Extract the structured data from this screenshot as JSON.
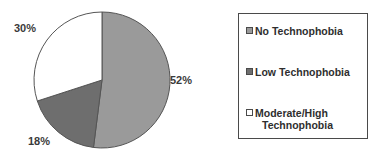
{
  "chart_data": {
    "type": "pie",
    "title": "",
    "subtitle": "",
    "xlabel": "",
    "ylabel": "",
    "grid": false,
    "legend_position": "right",
    "categories": [
      "No Technophobia",
      "Low Technophobia",
      "Moderate/High Technophobia"
    ],
    "values": [
      52,
      18,
      30
    ],
    "value_labels": [
      "52%",
      "18%",
      "30%"
    ],
    "unit": "%",
    "start_angle_deg": 0,
    "direction": "clockwise",
    "slices": [
      {
        "label": "No Technophobia",
        "value": 52,
        "display": "52%",
        "color": "#9a9a9a",
        "start_deg": 0,
        "end_deg": 187.2
      },
      {
        "label": "Low Technophobia",
        "value": 18,
        "display": "18%",
        "color": "#6e6e6e",
        "start_deg": 187.2,
        "end_deg": 252.0
      },
      {
        "label": "Moderate/High Technophobia",
        "value": 30,
        "display": "30%",
        "color": "#ffffff",
        "start_deg": 252.0,
        "end_deg": 360.0
      }
    ]
  },
  "pie": {
    "labels": {
      "moderate_high": "30%",
      "no_technophobia": "52%",
      "low_technophobia": "18%"
    },
    "outline_color": "#555555"
  },
  "legend": {
    "border_color": "#4a4a4a",
    "background": "#ffffff",
    "items": [
      {
        "label": "No Technophobia",
        "label_line2": "",
        "swatch_color": "#9a9a9a",
        "swatch_name": "legend-swatch-no-technophobia"
      },
      {
        "label": "Low Technophobia",
        "label_line2": "",
        "swatch_color": "#6e6e6e",
        "swatch_name": "legend-swatch-low-technophobia"
      },
      {
        "label": "Moderate/High",
        "label_line2": "Technophobia",
        "swatch_color": "#ffffff",
        "swatch_name": "legend-swatch-moderate-high-technophobia"
      }
    ]
  }
}
